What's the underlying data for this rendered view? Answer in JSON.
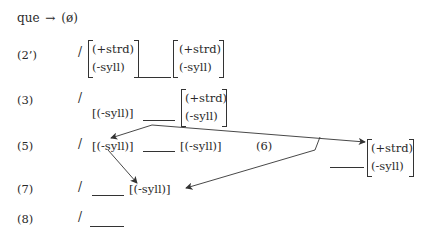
{
  "rule": {
    "lhs": "que",
    "arrow": "→",
    "rhs": "(ø)"
  },
  "lines": [
    {
      "label": "(2’)",
      "slash": "/",
      "left_matrix": [
        "(+strd)",
        "(-syll)"
      ],
      "right_matrix": [
        "(+strd)",
        "(-syll)"
      ]
    },
    {
      "label": "(3)",
      "slash": "/",
      "left": "[(-syll)]",
      "right_matrix": [
        "(+strd)",
        "(-syll)"
      ]
    },
    {
      "label": "(5)",
      "slash": "/",
      "left": "[(-syll)]",
      "right": "[(-syll)]"
    },
    {
      "label": "(6)",
      "slash": "/",
      "right_matrix": [
        "(+strd)",
        "(-syll)"
      ]
    },
    {
      "label": "(7)",
      "slash": "/",
      "right": "[(-syll)]"
    },
    {
      "label": "(8)",
      "slash": "/"
    }
  ]
}
